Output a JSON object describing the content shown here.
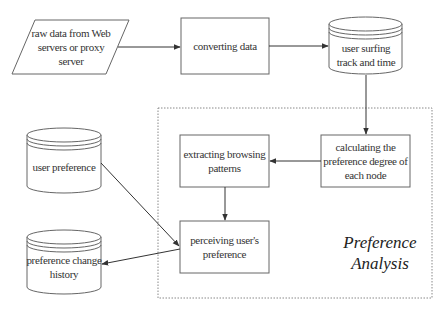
{
  "diagram": {
    "nodes": [
      {
        "id": "raw-data",
        "shape": "parallelogram",
        "label": "raw data from Web servers or proxy server"
      },
      {
        "id": "converting-data",
        "shape": "rectangle",
        "label": "converting data"
      },
      {
        "id": "user-surfing",
        "shape": "cylinder",
        "label": "user surfing track and time"
      },
      {
        "id": "calculating",
        "shape": "rectangle",
        "label": "calculating the preference degree of each node"
      },
      {
        "id": "extracting",
        "shape": "rectangle",
        "label": "extracting browsing patterns"
      },
      {
        "id": "user-preference",
        "shape": "cylinder",
        "label": "user preference"
      },
      {
        "id": "perceiving",
        "shape": "rectangle",
        "label": "perceiving user's preference"
      },
      {
        "id": "preference-history",
        "shape": "cylinder",
        "label": "preference change history"
      }
    ],
    "edges": [
      {
        "from": "raw-data",
        "to": "converting-data"
      },
      {
        "from": "converting-data",
        "to": "user-surfing"
      },
      {
        "from": "user-surfing",
        "to": "calculating"
      },
      {
        "from": "calculating",
        "to": "extracting"
      },
      {
        "from": "extracting",
        "to": "perceiving"
      },
      {
        "from": "user-preference",
        "to": "perceiving"
      },
      {
        "from": "perceiving",
        "to": "preference-history"
      }
    ],
    "region": {
      "label_line1": "Preference",
      "label_line2": "Analysis",
      "style": "dashed"
    },
    "colors": {
      "stroke": "#555555",
      "background": "#ffffff",
      "text": "#333333"
    }
  }
}
